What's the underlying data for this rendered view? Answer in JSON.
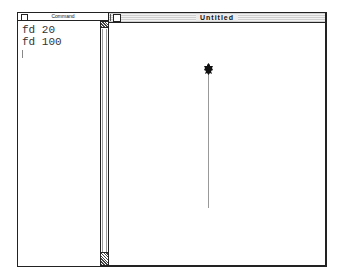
{
  "command_window": {
    "title": "Command",
    "lines": [
      "fd 20",
      "fd 100"
    ]
  },
  "graphics_window": {
    "title": "Untitled",
    "turtle": {
      "heading": "up",
      "color": "#111111"
    },
    "trail_color": "#999999"
  }
}
